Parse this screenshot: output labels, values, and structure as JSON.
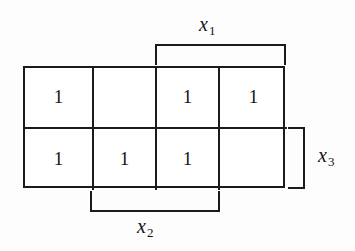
{
  "diagram": {
    "type": "karnaugh-map",
    "title": "",
    "grid": {
      "rows": 2,
      "columns": 4,
      "cells": [
        [
          {
            "value": "1",
            "filled": true
          },
          {
            "value": "",
            "filled": false
          },
          {
            "value": "1",
            "filled": true
          },
          {
            "value": "1",
            "filled": true
          }
        ],
        [
          {
            "value": "1",
            "filled": true
          },
          {
            "value": "1",
            "filled": true
          },
          {
            "value": "1",
            "filled": true
          },
          {
            "value": "",
            "filled": false
          }
        ]
      ]
    },
    "brackets": [
      {
        "id": "x1",
        "variable": "x",
        "subscript": "1",
        "position": "top",
        "spans": "columns 3-4",
        "tick_direction": "down"
      },
      {
        "id": "x2",
        "variable": "x",
        "subscript": "2",
        "position": "bottom",
        "spans": "columns 2-3",
        "tick_direction": "up"
      },
      {
        "id": "x3",
        "variable": "x",
        "subscript": "3",
        "position": "right",
        "spans": "row 2",
        "tick_direction": "left"
      }
    ],
    "colors": {
      "background": "#fdfdfd",
      "line": "#1b1b1b",
      "text": "#141414"
    }
  }
}
